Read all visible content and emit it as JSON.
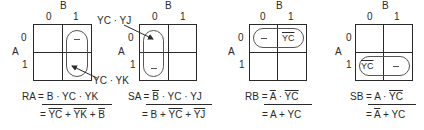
{
  "maps": [
    {
      "id": "RA",
      "col_var": "B",
      "row_var": "A",
      "col_labels": [
        "0",
        "1"
      ],
      "row_labels": [
        "0",
        "1"
      ],
      "loop_cells": "column B=1 (vertical)",
      "annotations": {
        "top": "YC · YJ",
        "bottom": "YC · YK"
      },
      "cell_marks": {
        "top": "–",
        "bottom": ""
      },
      "equation_line1": "RA = B · YC · YK",
      "equation_line2_parts": [
        "= ",
        "YC",
        " + ",
        "YK",
        " + ",
        "B"
      ]
    },
    {
      "id": "SA",
      "col_var": "B",
      "row_var": "A",
      "col_labels": [
        "0",
        "1"
      ],
      "row_labels": [
        "0",
        "1"
      ],
      "loop_cells": "column B=0 (vertical)",
      "cell_marks": {
        "top": "",
        "bottom": "–"
      },
      "equation_line1_parts": [
        "SA = ",
        "B",
        " · YC · YJ"
      ],
      "equation_line2_parts": [
        "= B + ",
        "YC",
        " + ",
        "YJ"
      ]
    },
    {
      "id": "RB",
      "col_var": "B",
      "row_var": "A",
      "col_labels": [
        "0",
        "1"
      ],
      "row_labels": [
        "0",
        "1"
      ],
      "loop_cells": "row A=0 (horizontal)",
      "cell_marks": {
        "left": "–",
        "right": "YC"
      },
      "equation_line1_parts": [
        "RB = ",
        "A",
        " · ",
        "YC"
      ],
      "equation_line2": "= A + YC"
    },
    {
      "id": "SB",
      "col_var": "B",
      "row_var": "A",
      "col_labels": [
        "0",
        "1"
      ],
      "row_labels": [
        "0",
        "1"
      ],
      "loop_cells": "row A=1 (horizontal)",
      "cell_marks": {
        "left": "YC",
        "right": "–"
      },
      "equation_line1_parts": [
        "SB = A · ",
        "YC"
      ],
      "equation_line2_parts": [
        "= ",
        "A",
        " + YC"
      ]
    }
  ]
}
